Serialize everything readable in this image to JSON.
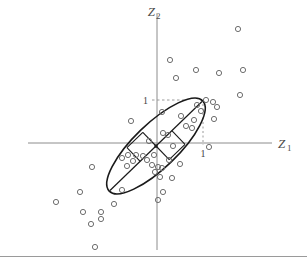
{
  "figure": {
    "background_color": "#ffffff",
    "axis_color": "#8c8c8c",
    "ellipse_color": "#1a1a1a",
    "point_color": "#6e6e6e",
    "guide_color": "#9a9a9a",
    "border_color": "#9a9a9a"
  },
  "axes": {
    "x_axis_label_main": "Z",
    "x_axis_label_sub": "1",
    "y_axis_label_main": "Z",
    "y_axis_label_sub": "2",
    "x_tick_label": "1",
    "y_tick_label": "1"
  },
  "chart_data": {
    "type": "scatter",
    "title": "",
    "xlabel": "Z1",
    "ylabel": "Z2",
    "xlim": [
      -3.2,
      3.2
    ],
    "ylim": [
      -3.1,
      3.1
    ],
    "grid": false,
    "legend": null,
    "origin_px": [
      157,
      143
    ],
    "unit_px": 45,
    "annotations": [
      {
        "text": "1",
        "axis": "y",
        "value": 1,
        "px": [
          147,
          101
        ],
        "guide": "dashed-horizontal-to-ellipse"
      },
      {
        "text": "1",
        "axis": "x",
        "value": 1,
        "px": [
          202,
          156
        ],
        "guide": "dotted-vertical-to-ellipse"
      }
    ],
    "ellipse": {
      "center": [
        0.0,
        0.0
      ],
      "semi_major": 1.48,
      "semi_minor": 0.5,
      "rotation_deg": 44,
      "center_px": [
        156,
        146
      ],
      "semi_major_px": 65,
      "semi_minor_px": 22,
      "description": "Contour ellipse of bivariate distribution with principal-axis lines drawn through center and right-angle tick marks"
    },
    "points_px": [
      [
        238,
        29
      ],
      [
        243,
        70
      ],
      [
        240,
        95
      ],
      [
        196,
        70
      ],
      [
        219,
        73
      ],
      [
        170,
        60
      ],
      [
        176,
        78
      ],
      [
        213,
        102
      ],
      [
        217,
        107
      ],
      [
        206,
        100
      ],
      [
        197,
        105
      ],
      [
        201,
        111
      ],
      [
        214,
        119
      ],
      [
        194,
        120
      ],
      [
        192,
        128
      ],
      [
        181,
        116
      ],
      [
        186,
        126
      ],
      [
        131,
        121
      ],
      [
        162,
        112
      ],
      [
        163,
        133
      ],
      [
        168,
        135
      ],
      [
        173,
        146
      ],
      [
        209,
        147
      ],
      [
        149,
        141
      ],
      [
        128,
        155
      ],
      [
        122,
        158
      ],
      [
        136,
        155
      ],
      [
        133,
        161
      ],
      [
        127,
        166
      ],
      [
        143,
        156
      ],
      [
        147,
        160
      ],
      [
        154,
        155
      ],
      [
        152,
        165
      ],
      [
        158,
        167
      ],
      [
        155,
        172
      ],
      [
        162,
        168
      ],
      [
        169,
        160
      ],
      [
        180,
        164
      ],
      [
        160,
        177
      ],
      [
        172,
        178
      ],
      [
        163,
        192
      ],
      [
        158,
        200
      ],
      [
        92,
        167
      ],
      [
        80,
        192
      ],
      [
        122,
        190
      ],
      [
        114,
        204
      ],
      [
        56,
        202
      ],
      [
        83,
        212
      ],
      [
        101,
        212
      ],
      [
        101,
        219
      ],
      [
        91,
        224
      ],
      [
        95,
        247
      ]
    ],
    "n_points": 52,
    "point_marker": "open-circle",
    "point_radius_px": 2.6
  }
}
